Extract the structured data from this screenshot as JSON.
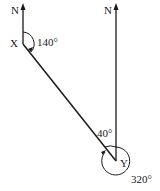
{
  "diagram": {
    "type": "bearing",
    "points": {
      "x": {
        "label": "X",
        "bearing_label": "140°"
      },
      "y": {
        "label": "Y",
        "bearing_label": "320°",
        "angle_label": "40°"
      }
    },
    "north_labels": [
      "N",
      "N"
    ],
    "stroke_color": "#1a1a1a"
  }
}
